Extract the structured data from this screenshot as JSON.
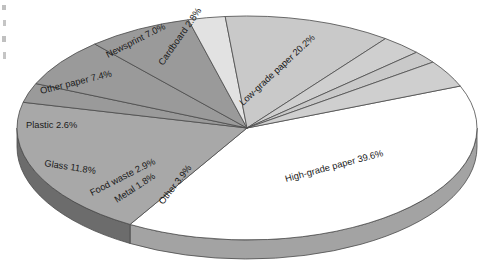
{
  "chart_data": {
    "type": "pie",
    "title": "",
    "subtitle": "",
    "xlabel": "",
    "ylabel": "",
    "legend": "none",
    "grid": false,
    "style": "3d-exploded-none",
    "units": "percent",
    "categories": [
      "High-grade paper",
      "Low-grade paper",
      "Cardboard",
      "Newsprint",
      "Other paper",
      "Plastic",
      "Glass",
      "Food waste",
      "Metal",
      "Other"
    ],
    "values": [
      39.6,
      20.2,
      2.8,
      7.0,
      7.4,
      2.6,
      11.8,
      2.9,
      1.8,
      3.9
    ],
    "slices": [
      {
        "name": "High-grade paper",
        "value": 39.6,
        "label": "High-grade paper 39.6%",
        "color": "#ffffff",
        "label_x": 286,
        "label_y": 182,
        "label_rotate": -15
      },
      {
        "name": "Low-grade paper",
        "value": 20.2,
        "label": "Low-grade paper 20.2%",
        "color": "#a8a8a8",
        "label_x": 243,
        "label_y": 106,
        "label_rotate": -43
      },
      {
        "name": "Cardboard",
        "value": 2.8,
        "label": "Cardboard 2.8%",
        "color": "#9a9a9a",
        "label_x": 163,
        "label_y": 66,
        "label_rotate": -55
      },
      {
        "name": "Newsprint",
        "value": 7.0,
        "label": "Newsprint 7.0%",
        "color": "#9a9a9a",
        "label_x": 108,
        "label_y": 58,
        "label_rotate": -27
      },
      {
        "name": "Other paper",
        "value": 7.4,
        "label": "Other paper 7.4%",
        "color": "#9a9a9a",
        "label_x": 41,
        "label_y": 94,
        "label_rotate": -14
      },
      {
        "name": "Plastic",
        "value": 2.6,
        "label": "Plastic 2.6%",
        "color": "#e2e2e2",
        "label_x": 26,
        "label_y": 128,
        "label_rotate": 0
      },
      {
        "name": "Glass",
        "value": 11.8,
        "label": "Glass 11.8%",
        "color": "#c9c9c9",
        "label_x": 44,
        "label_y": 166,
        "label_rotate": 9
      },
      {
        "name": "Food waste",
        "value": 2.9,
        "label": "Food waste 2.9%",
        "color": "#cfcfcf",
        "label_x": 92,
        "label_y": 196,
        "label_rotate": -27
      },
      {
        "name": "Metal",
        "value": 1.8,
        "label": "Metal 1.8%",
        "color": "#c9c9c9",
        "label_x": 117,
        "label_y": 203,
        "label_rotate": -33
      },
      {
        "name": "Other",
        "value": 3.9,
        "label": "Other 3.9%",
        "color": "#cfcfcf",
        "label_x": 163,
        "label_y": 205,
        "label_rotate": -52
      }
    ],
    "geometry": {
      "center_x": 247,
      "center_y": 128,
      "radius_x": 230,
      "radius_y": 112,
      "depth": 19,
      "start_angle_deg": -22
    }
  }
}
